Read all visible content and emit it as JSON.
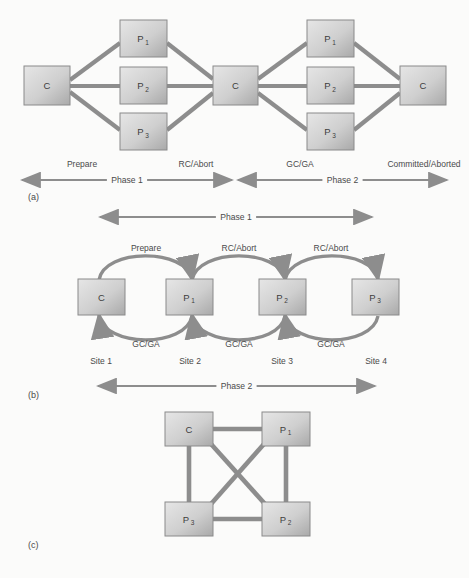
{
  "figure": {
    "background": "#fbfbfa",
    "node_fill_light": "#e3e3e3",
    "node_fill_dark": "#a8a8a8",
    "node_stroke": "#8a8a8a",
    "edge_color": "#8d8d8d",
    "text_color": "#4a4a4a"
  },
  "panels": [
    {
      "id": "a",
      "caption": "(a)",
      "nodes": [
        {
          "id": "a-c-left",
          "label": "C",
          "sub": "",
          "x": 24,
          "y": 66,
          "w": 46,
          "h": 39
        },
        {
          "id": "a-p1-l",
          "label": "P",
          "sub": "1",
          "x": 120,
          "y": 20,
          "w": 47,
          "h": 37
        },
        {
          "id": "a-p2-l",
          "label": "P",
          "sub": "2",
          "x": 120,
          "y": 67,
          "w": 47,
          "h": 37
        },
        {
          "id": "a-p3-l",
          "label": "P",
          "sub": "3",
          "x": 120,
          "y": 113,
          "w": 47,
          "h": 37
        },
        {
          "id": "a-c-mid",
          "label": "C",
          "sub": "",
          "x": 213,
          "y": 66,
          "w": 45,
          "h": 39
        },
        {
          "id": "a-p1-r",
          "label": "P",
          "sub": "1",
          "x": 307,
          "y": 20,
          "w": 47,
          "h": 37
        },
        {
          "id": "a-p2-r",
          "label": "P",
          "sub": "2",
          "x": 307,
          "y": 67,
          "w": 47,
          "h": 37
        },
        {
          "id": "a-p3-r",
          "label": "P",
          "sub": "3",
          "x": 307,
          "y": 113,
          "w": 47,
          "h": 37
        },
        {
          "id": "a-c-right",
          "label": "C",
          "sub": "",
          "x": 400,
          "y": 66,
          "w": 46,
          "h": 39
        }
      ],
      "edge_labels": [
        {
          "id": "a-lab-prepare",
          "text": "Prepare",
          "x": 82,
          "y": 167
        },
        {
          "id": "a-lab-rcabort",
          "text": "RC/Abort",
          "x": 196,
          "y": 167
        },
        {
          "id": "a-lab-gcga",
          "text": "GC/GA",
          "x": 300,
          "y": 167
        },
        {
          "id": "a-lab-committed",
          "text": "Committed/Aborted",
          "x": 424,
          "y": 167
        }
      ],
      "phase_bars": [
        {
          "id": "a-phase1",
          "text": "Phase 1",
          "x1": 22,
          "x2": 232,
          "y": 180
        },
        {
          "id": "a-phase2",
          "text": "Phase 2",
          "x1": 238,
          "x2": 447,
          "y": 180
        }
      ]
    },
    {
      "id": "b",
      "caption": "(b)",
      "top_phase_bar": {
        "id": "b-phase1",
        "text": "Phase 1",
        "x1": 100,
        "x2": 372,
        "y": 217
      },
      "nodes": [
        {
          "id": "b-c",
          "label": "C",
          "sub": "",
          "x": 78,
          "y": 279,
          "w": 47,
          "h": 36
        },
        {
          "id": "b-p1",
          "label": "P",
          "sub": "1",
          "x": 166,
          "y": 279,
          "w": 47,
          "h": 36
        },
        {
          "id": "b-p2",
          "label": "P",
          "sub": "2",
          "x": 259,
          "y": 279,
          "w": 47,
          "h": 36
        },
        {
          "id": "b-p3",
          "label": "P",
          "sub": "3",
          "x": 352,
          "y": 279,
          "w": 47,
          "h": 36
        }
      ],
      "top_arc_labels": [
        {
          "id": "b-lab-prepare",
          "text": "Prepare",
          "x": 146,
          "y": 251
        },
        {
          "id": "b-lab-rcabort1",
          "text": "RC/Abort",
          "x": 239,
          "y": 251
        },
        {
          "id": "b-lab-rcabort2",
          "text": "RC/Abort",
          "x": 331,
          "y": 251
        }
      ],
      "bottom_arc_labels": [
        {
          "id": "b-lab-gcga1",
          "text": "GC/GA",
          "x": 146,
          "y": 347
        },
        {
          "id": "b-lab-gcga2",
          "text": "GC/GA",
          "x": 239,
          "y": 347
        },
        {
          "id": "b-lab-gcga3",
          "text": "GC/GA",
          "x": 331,
          "y": 347
        }
      ],
      "site_labels": [
        {
          "id": "b-site1",
          "text": "Site 1",
          "x": 101,
          "y": 364
        },
        {
          "id": "b-site2",
          "text": "Site 2",
          "x": 190,
          "y": 364
        },
        {
          "id": "b-site3",
          "text": "Site 3",
          "x": 282,
          "y": 364
        },
        {
          "id": "b-site4",
          "text": "Site 4",
          "x": 376,
          "y": 364
        }
      ],
      "bottom_phase_bar": {
        "id": "b-phase2",
        "text": "Phase 2",
        "x1": 98,
        "x2": 375,
        "y": 386
      }
    },
    {
      "id": "c",
      "caption": "(c)",
      "nodes": [
        {
          "id": "c-c",
          "label": "C",
          "sub": "",
          "x": 165,
          "y": 412,
          "w": 48,
          "h": 34
        },
        {
          "id": "c-p1",
          "label": "P",
          "sub": "1",
          "x": 262,
          "y": 412,
          "w": 48,
          "h": 34
        },
        {
          "id": "c-p3",
          "label": "P",
          "sub": "3",
          "x": 165,
          "y": 502,
          "w": 48,
          "h": 34
        },
        {
          "id": "c-p2",
          "label": "P",
          "sub": "2",
          "x": 262,
          "y": 502,
          "w": 48,
          "h": 34
        }
      ]
    }
  ],
  "captions": [
    {
      "id": "caption-a",
      "text": "(a)",
      "x": 28,
      "y": 200
    },
    {
      "id": "caption-b",
      "text": "(b)",
      "x": 28,
      "y": 398
    },
    {
      "id": "caption-c",
      "text": "(c)",
      "x": 28,
      "y": 548
    }
  ]
}
